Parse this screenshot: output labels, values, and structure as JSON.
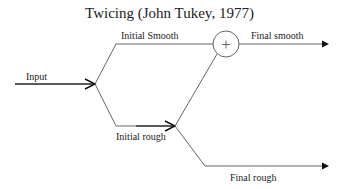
{
  "title": "Twicing (John Tukey, 1977)",
  "nodes": {
    "sum": {
      "symbol": "+"
    }
  },
  "labels": {
    "input": "Input",
    "initial_smooth": "Initial Smooth",
    "initial_rough": "Initial rough",
    "final_smooth": "Final smooth",
    "final_rough": "Final rough"
  },
  "colors": {
    "line": "#555555",
    "arrow": "#111111"
  }
}
